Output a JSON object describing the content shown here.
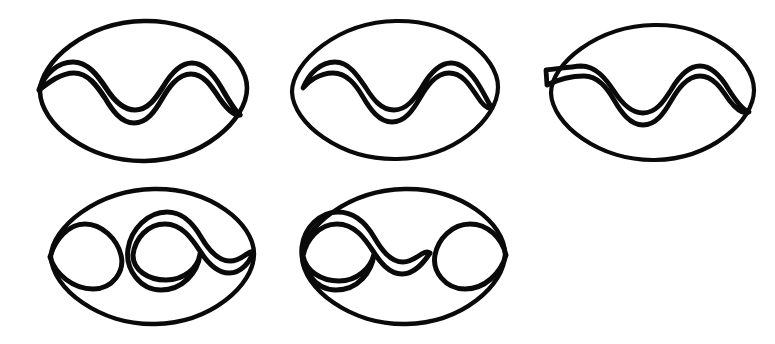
{
  "canvas": {
    "width": 775,
    "height": 344,
    "background_color": "#ffffff",
    "stroke_color": "#0a0a0a",
    "style": "hand-drawn ink line art",
    "figure_count": 5,
    "rows": 2,
    "columns_row1": 3,
    "columns_row2": 2
  },
  "figures": [
    {
      "id": "figure-1",
      "name": "oval-with-three-peak-wave-touching-both-ends",
      "position": "row-1-col-1",
      "oval": {
        "cx": 143,
        "cy": 90,
        "rx": 104,
        "ry": 70,
        "stroke_width": 4.6,
        "rotation": -1.5
      },
      "inner": {
        "type": "zigzag-wave",
        "peaks": 3,
        "troughs": 3,
        "left_end": "meets-oval-left-vertex",
        "right_end": "meets-oval-right-vertex",
        "x_start": 39,
        "x_end": 241,
        "y_center": 90,
        "amplitude": 31,
        "stroke_width": 5.2
      }
    },
    {
      "id": "figure-2",
      "name": "oval-with-three-peak-wave-inset-left",
      "position": "row-1-col-2",
      "oval": {
        "cx": 395,
        "cy": 89,
        "rx": 104,
        "ry": 69,
        "stroke_width": 4.2,
        "rotation": -1.0
      },
      "inner": {
        "type": "zigzag-wave",
        "peaks": 3,
        "troughs": 3,
        "left_end": "inset-inside-oval",
        "right_end": "meets-oval-right-vertex",
        "x_start": 302,
        "x_end": 492,
        "y_center": 89,
        "amplitude": 30,
        "stroke_width": 4.8
      }
    },
    {
      "id": "figure-3",
      "name": "oval-with-three-peak-wave-crossing-left-edge",
      "position": "row-1-col-3",
      "oval": {
        "cx": 652,
        "cy": 91,
        "rx": 102,
        "ry": 67,
        "stroke_width": 4.2,
        "rotation": -1.0
      },
      "inner": {
        "type": "zigzag-wave",
        "peaks": 3,
        "troughs": 3,
        "left_end": "crosses-outside-oval-left-edge",
        "right_end": "meets-oval-right-vertex",
        "x_start": 546,
        "x_end": 748,
        "y_center": 93,
        "amplitude": 31,
        "stroke_width": 4.8
      }
    },
    {
      "id": "figure-4",
      "name": "oval-with-left-loop-and-figure-eight",
      "position": "row-2-col-1",
      "oval": {
        "cx": 152,
        "cy": 255,
        "rx": 101,
        "ry": 67,
        "stroke_width": 4.4,
        "rotation": -1.2
      },
      "inner": {
        "type": "loop-then-figure-eight",
        "left_loop": {
          "cx": 86,
          "cy": 255,
          "rx": 36,
          "ry": 32
        },
        "figure_eight": {
          "x_start": 124,
          "x_end": 254,
          "y_center": 255,
          "amplitude": 32,
          "peaks": 2
        },
        "gap_between": true,
        "stroke_width": 5.0
      }
    },
    {
      "id": "figure-5",
      "name": "oval-with-figure-eight-and-right-loop",
      "position": "row-2-col-2",
      "oval": {
        "cx": 403,
        "cy": 255,
        "rx": 101,
        "ry": 67,
        "stroke_width": 4.4,
        "rotation": -1.2
      },
      "inner": {
        "type": "figure-eight-then-loop",
        "figure_eight": {
          "x_start": 304,
          "x_end": 434,
          "y_center": 255,
          "amplitude": 32,
          "peaks": 2
        },
        "right_loop": {
          "cx": 468,
          "cy": 255,
          "rx": 36,
          "ry": 32
        },
        "gap_between": true,
        "stroke_width": 5.0
      }
    }
  ]
}
